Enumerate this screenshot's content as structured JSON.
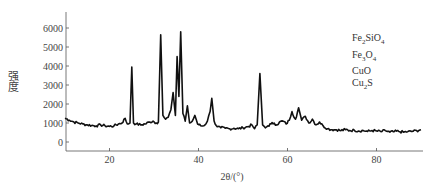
{
  "chart_data": {
    "type": "line",
    "title": "",
    "xlabel": "2θ/(°)",
    "ylabel": "强度",
    "xlim": [
      10,
      90
    ],
    "ylim": [
      -400,
      6500
    ],
    "xticks": [
      20,
      40,
      60,
      80
    ],
    "yticks": [
      0,
      1000,
      2000,
      3000,
      4000,
      5000,
      6000
    ],
    "grid": false,
    "legend_position": "upper right",
    "legend": [
      "Fe2SiO4",
      "Fe3O4",
      "CuO",
      "Cu2S"
    ],
    "series": [
      {
        "name": "XRD pattern",
        "color": "#111111",
        "x": [
          10,
          11,
          12,
          13,
          14,
          15,
          16,
          17,
          18,
          19,
          20,
          21,
          22,
          22.8,
          23.5,
          24,
          24.6,
          25,
          25.4,
          26,
          27,
          28,
          29,
          29.8,
          30.5,
          31,
          31.5,
          32,
          32.6,
          33.2,
          33.8,
          34.3,
          34.8,
          35.2,
          35.6,
          36,
          36.5,
          37,
          37.5,
          38,
          38.6,
          39.2,
          39.8,
          40.5,
          41.2,
          42,
          42.6,
          43,
          43.5,
          44.2,
          45,
          46,
          47,
          48,
          49,
          50,
          51,
          52,
          52.6,
          53.2,
          53.8,
          54.4,
          55,
          55.6,
          56.3,
          57,
          57.6,
          58.2,
          59,
          59.7,
          60.4,
          61,
          61.8,
          62.5,
          63.2,
          64,
          64.8,
          65.6,
          66.4,
          67.2,
          68,
          69,
          70,
          71,
          72,
          73,
          74,
          75,
          76,
          77,
          78,
          79,
          80,
          81,
          82,
          83,
          84,
          85,
          86,
          87,
          88,
          89,
          90
        ],
        "y": [
          1250,
          1150,
          1050,
          1000,
          950,
          900,
          870,
          850,
          900,
          850,
          820,
          850,
          950,
          1000,
          1250,
          950,
          1000,
          3950,
          1000,
          950,
          900,
          950,
          1050,
          1100,
          1000,
          1050,
          5650,
          1400,
          1200,
          1300,
          1700,
          2600,
          1400,
          4500,
          2400,
          5800,
          1500,
          1100,
          1900,
          1000,
          1100,
          1400,
          950,
          850,
          850,
          1100,
          1600,
          2300,
          1100,
          800,
          750,
          720,
          700,
          720,
          700,
          750,
          800,
          900,
          700,
          900,
          3600,
          900,
          750,
          850,
          950,
          1000,
          900,
          1050,
          1100,
          950,
          1150,
          1600,
          1200,
          1800,
          1150,
          1350,
          1000,
          1200,
          900,
          1050,
          850,
          700,
          650,
          650,
          600,
          650,
          600,
          620,
          580,
          600,
          560,
          600,
          580,
          550,
          600,
          520,
          550,
          560,
          520,
          540,
          560,
          600,
          650
        ]
      }
    ]
  },
  "axes": {
    "x_ticks": [
      "20",
      "40",
      "60",
      "80"
    ],
    "y_ticks": [
      "0",
      "1000",
      "2000",
      "3000",
      "4000",
      "5000",
      "6000"
    ],
    "x_title": "2θ/(°)",
    "y_title": "强度"
  },
  "legend": {
    "items": [
      {
        "base": "Fe",
        "sub1": "2",
        "mid": "SiO",
        "sub2": "4"
      },
      {
        "base": "Fe",
        "sub1": "3",
        "mid": "O",
        "sub2": "4"
      },
      {
        "base": "CuO",
        "sub1": "",
        "mid": "",
        "sub2": ""
      },
      {
        "base": "Cu",
        "sub1": "2",
        "mid": "S",
        "sub2": ""
      }
    ]
  }
}
